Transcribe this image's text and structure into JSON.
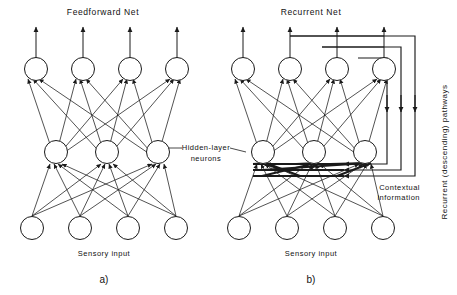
{
  "figure": {
    "caption_a": "a)",
    "caption_b": "b)"
  },
  "panel_a": {
    "title": "Feedforward Net",
    "input_label": "Sensory input",
    "layers": {
      "output_count": 4,
      "hidden_count": 3,
      "input_count": 4
    }
  },
  "panel_b": {
    "title": "Recurrent Net",
    "input_label": "Sensory input",
    "contextual_label_line1": "Contextual",
    "contextual_label_line2": "information",
    "recurrent_label": "Recurrent (descending) pathways",
    "layers": {
      "output_count": 4,
      "hidden_count": 3,
      "input_count": 4,
      "recurrent_pathways": 3,
      "contextual_inputs": 3
    }
  },
  "shared": {
    "hidden_label_line1": "Hidden-layer",
    "hidden_label_line2": "neurons"
  },
  "colors": {
    "ink": "#1a1a1a",
    "background": "#ffffff"
  }
}
